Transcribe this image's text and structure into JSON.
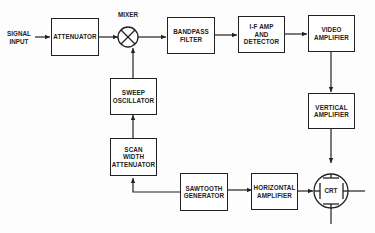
{
  "diagram": {
    "input_label": "SIGNAL\nINPUT",
    "mixer_label": "MIXER",
    "blocks": {
      "attenuator": "ATTENUATOR",
      "bandpass_filter": "BANDPASS\nFILTER",
      "if_amp_detector": "I-F AMP\nAND\nDETECTOR",
      "video_amplifier": "VIDEO\nAMPLIFIER",
      "vertical_amplifier": "VERTICAL\nAMPLIFIER",
      "sweep_oscillator": "SWEEP\nOSCILLATOR",
      "scan_width_attenuator": "SCAN\nWIDTH\nATTENUATOR",
      "sawtooth_generator": "SAWTOOTH\nGENERATOR",
      "horizontal_amplifier": "HORIZONTAL\nAMPLIFIER",
      "crt": "CRT"
    },
    "connections": [
      [
        "signal_input",
        "attenuator"
      ],
      [
        "attenuator",
        "mixer"
      ],
      [
        "mixer",
        "bandpass_filter"
      ],
      [
        "bandpass_filter",
        "if_amp_detector"
      ],
      [
        "if_amp_detector",
        "video_amplifier"
      ],
      [
        "video_amplifier",
        "vertical_amplifier"
      ],
      [
        "vertical_amplifier",
        "crt"
      ],
      [
        "sawtooth_generator",
        "scan_width_attenuator"
      ],
      [
        "scan_width_attenuator",
        "sweep_oscillator"
      ],
      [
        "sweep_oscillator",
        "mixer"
      ],
      [
        "sawtooth_generator",
        "horizontal_amplifier"
      ],
      [
        "horizontal_amplifier",
        "crt"
      ]
    ],
    "colors": {
      "line": "#222222",
      "background": "#fdfdfd"
    }
  }
}
